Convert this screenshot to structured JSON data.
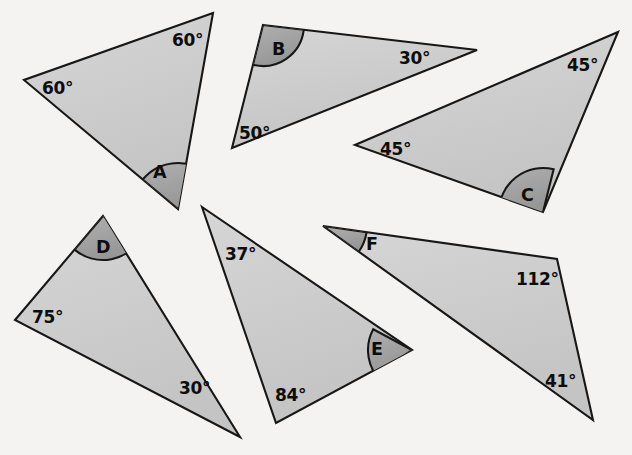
{
  "page": {
    "background_color": "#f4f3f1",
    "width": 632,
    "height": 455
  },
  "style": {
    "triangle_fill_light": "#d2d2d2",
    "triangle_fill_dark": "#c2c2c2",
    "arc_fill_light": "#a9a9a9",
    "arc_fill_dark": "#9a9a9a",
    "outline_color": "#171717",
    "text_color": "#0d0d0d"
  },
  "triangles": [
    {
      "id": "A",
      "letter": "A",
      "letter_pos": {
        "x": 153,
        "y": 178
      },
      "points": "213,13 24,80 178,209",
      "marked_vertex": {
        "x": 178,
        "y": 209
      },
      "arc_radius": 46,
      "arc_start_deg": 219.9,
      "arc_end_deg": 309.8,
      "known_angles": [
        {
          "value": "60°",
          "x": 172,
          "y": 46
        },
        {
          "value": "60°",
          "x": 42,
          "y": 94
        }
      ]
    },
    {
      "id": "B",
      "letter": "B",
      "letter_pos": {
        "x": 272,
        "y": 55
      },
      "points": "263,25 477,50 232,148",
      "marked_vertex": {
        "x": 263,
        "y": 25
      },
      "arc_radius": 41,
      "arc_start_deg": 6.7,
      "arc_end_deg": 104.2,
      "known_angles": [
        {
          "value": "30°",
          "x": 399,
          "y": 64
        },
        {
          "value": "50°",
          "x": 239,
          "y": 139
        }
      ]
    },
    {
      "id": "C",
      "letter": "C",
      "letter_pos": {
        "x": 521,
        "y": 201
      },
      "points": "618,32 355,145 543,212",
      "marked_vertex": {
        "x": 543,
        "y": 212
      },
      "arc_radius": 44,
      "arc_start_deg": 180.5,
      "arc_end_deg": 284.0,
      "known_angles": [
        {
          "value": "45°",
          "x": 567,
          "y": 71
        },
        {
          "value": "45°",
          "x": 380,
          "y": 155
        }
      ]
    },
    {
      "id": "D",
      "letter": "D",
      "letter_pos": {
        "x": 96,
        "y": 253
      },
      "points": "103,216 15,320 240,437",
      "marked_vertex": {
        "x": 103,
        "y": 216
      },
      "arc_radius": 44,
      "arc_start_deg": 27.5,
      "arc_end_deg": 130.2,
      "known_angles": [
        {
          "value": "75°",
          "x": 32,
          "y": 323
        },
        {
          "value": "30°",
          "x": 179,
          "y": 394
        }
      ]
    },
    {
      "id": "E",
      "letter": "E",
      "letter_pos": {
        "x": 371,
        "y": 355
      },
      "points": "202,207 412,350 276,423",
      "marked_vertex": {
        "x": 412,
        "y": 350
      },
      "arc_radius": 44,
      "arc_start_deg": 145.8,
      "arc_end_deg": 208.2,
      "known_angles": [
        {
          "value": "37°",
          "x": 225,
          "y": 260
        },
        {
          "value": "84°",
          "x": 275,
          "y": 401
        }
      ]
    },
    {
      "id": "F",
      "letter": "F",
      "letter_pos": {
        "x": 366,
        "y": 250
      },
      "points": "323,226 557,259 593,420",
      "marked_vertex": {
        "x": 323,
        "y": 226
      },
      "arc_radius": 44,
      "arc_start_deg": 8.0,
      "arc_end_deg": 35.8,
      "known_angles": [
        {
          "value": "112°",
          "x": 516,
          "y": 285
        },
        {
          "value": "41°",
          "x": 545,
          "y": 387
        }
      ]
    }
  ]
}
